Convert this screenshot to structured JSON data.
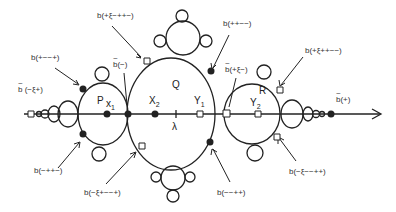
{
  "figure": {
    "type": "hand-drawn limb/bulb diagram on a real axis",
    "axis": {
      "arrow": "right"
    },
    "regions": [
      {
        "id": "P",
        "label": "P"
      },
      {
        "id": "Q",
        "label": "Q"
      },
      {
        "id": "R",
        "label": "R"
      }
    ],
    "points": [
      {
        "id": "x1",
        "label": "x1",
        "base": "x",
        "sub": "1",
        "marker": "filled-dot"
      },
      {
        "id": "x2",
        "label": "X2",
        "base": "X",
        "sub": "2",
        "marker": "filled-dot"
      },
      {
        "id": "lambda",
        "label": "λ",
        "marker": "tick"
      },
      {
        "id": "y1",
        "label": "Y1",
        "base": "Y",
        "sub": "1",
        "marker": "open-square"
      },
      {
        "id": "y2",
        "label": "Y2",
        "base": "Y",
        "sub": "2",
        "marker": "open-square"
      }
    ],
    "annotations": [
      {
        "id": "b-plus-xi-minus-plusplus-minus",
        "text": "b(+ξ−++−)"
      },
      {
        "id": "b-plusplus-minusminus",
        "text": "b(++−−)"
      },
      {
        "id": "b-plus-xi-plusplus-minusminus",
        "text": "b(+ξ++−−)"
      },
      {
        "id": "b-plus-minusminus-plus",
        "text": "b(+−−+)"
      },
      {
        "id": "btilde-minus",
        "text": "b(−)",
        "tilde": true
      },
      {
        "id": "btilde-plus-xi-minus",
        "text": "b(+ξ−)",
        "tilde": true
      },
      {
        "id": "btilde-minus-xi-plus",
        "text": "b (−ξ+)",
        "tilde": true
      },
      {
        "id": "btilde-plus",
        "text": "b(+)",
        "tilde": true
      },
      {
        "id": "b-minus-plusplus-minus",
        "text": "b(−++−)"
      },
      {
        "id": "b-minus-xi-plus-minusminus-plus",
        "text": "b(−ξ+−−+)"
      },
      {
        "id": "b-minusminus-plusplus",
        "text": "b(−−++)"
      },
      {
        "id": "b-minus-xi-minusminus-plusplus",
        "text": "b(−ξ−−++)"
      }
    ]
  },
  "colors": {
    "ink": "#222222",
    "background": "#ffffff"
  }
}
